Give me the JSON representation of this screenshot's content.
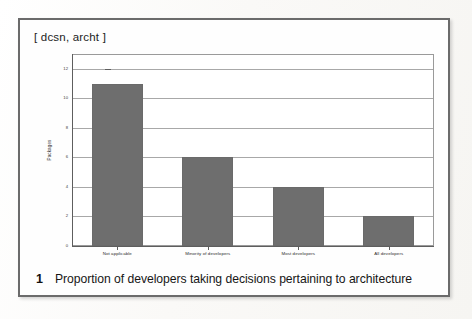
{
  "figure": {
    "header_tag": "[ dcsn, archt ]",
    "caption_number": "1",
    "caption_text": "Proportion of developers taking decisions pertaining to architecture"
  },
  "chart_data": {
    "type": "bar",
    "title": "[ dcsn, archt ]",
    "categories": [
      "Not applicable",
      "Minority of developers",
      "Most developers",
      "All developers"
    ],
    "values": [
      11,
      6,
      4,
      2
    ],
    "xlabel": "",
    "ylabel": "Packages",
    "ylim": [
      0,
      13
    ],
    "yticks": [
      0,
      2,
      4,
      6,
      8,
      10,
      12
    ],
    "ytick_labels": [
      "0",
      "2",
      "4",
      "6",
      "8",
      "10",
      "12"
    ],
    "grid": true,
    "grid_axis": "y",
    "legend": false,
    "bar_color": "#6e6e6e",
    "plot_background": "#ffffff",
    "axis_color": "#5e5e5e",
    "gridline_color": "#a8a8a8"
  }
}
